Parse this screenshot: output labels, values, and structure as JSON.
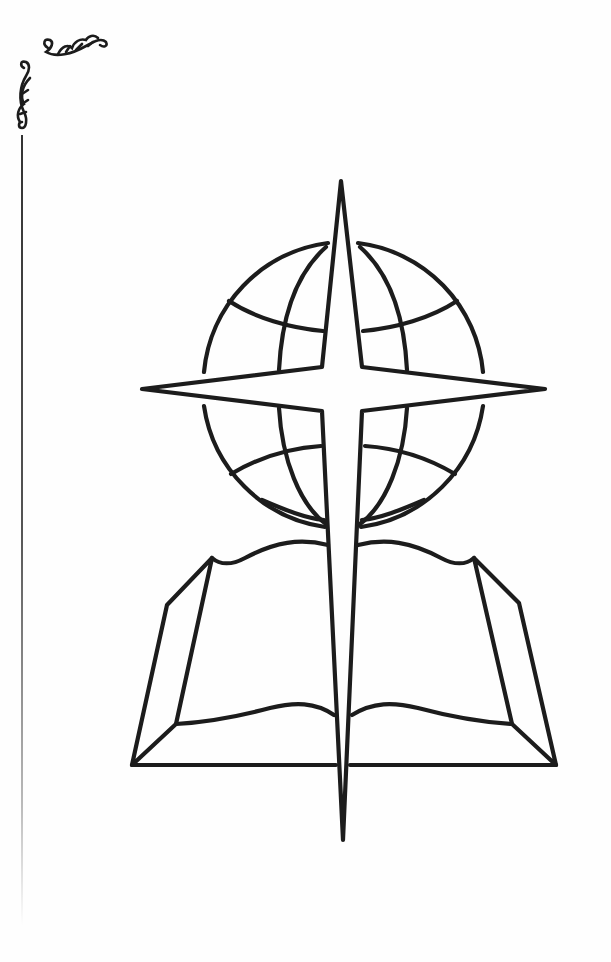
{
  "page": {
    "background": "#fefefe",
    "ink_color": "#1c1c1c"
  },
  "ornament": {
    "name": "corner flourish",
    "position": "top-left"
  },
  "emblem": {
    "description": "Globe with four-pointed star cross over an open book",
    "elements": [
      "globe",
      "star-cross",
      "open-book"
    ]
  }
}
